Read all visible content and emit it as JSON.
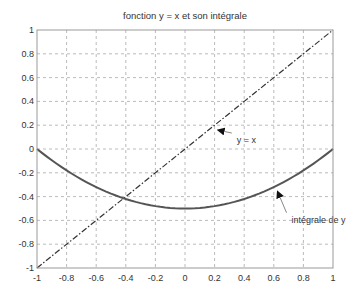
{
  "chart_data": {
    "type": "line",
    "title": "fonction y = x et son intégrale",
    "xlabel": "",
    "ylabel": "",
    "xlim": [
      -1,
      1
    ],
    "ylim": [
      -1,
      1
    ],
    "grid": true,
    "xticks": [
      -1,
      -0.8,
      -0.6,
      -0.4,
      -0.2,
      0,
      0.2,
      0.4,
      0.6,
      0.8,
      1
    ],
    "yticks": [
      -1,
      -0.8,
      -0.6,
      -0.4,
      -0.2,
      0,
      0.2,
      0.4,
      0.6,
      0.8,
      1
    ],
    "xtick_labels": [
      "-1",
      "-0.8",
      "-0.6",
      "-0.4",
      "-0.2",
      "0",
      "0.2",
      "0.4",
      "0.6",
      "0.8",
      "1"
    ],
    "ytick_labels": [
      "-1",
      "-0.8",
      "-0.6",
      "-0.4",
      "-0.2",
      "0",
      "0.2",
      "0.4",
      "0.6",
      "0.8",
      "1"
    ],
    "series": [
      {
        "name": "y = x",
        "style": "dash-dot",
        "color": "#333333",
        "x": [
          -1,
          -0.8,
          -0.6,
          -0.4,
          -0.2,
          0,
          0.2,
          0.4,
          0.6,
          0.8,
          1
        ],
        "y": [
          -1,
          -0.8,
          -0.6,
          -0.4,
          -0.2,
          0,
          0.2,
          0.4,
          0.6,
          0.8,
          1
        ]
      },
      {
        "name": "intégrale de y",
        "style": "solid",
        "color": "#555555",
        "x": [
          -1,
          -0.8,
          -0.6,
          -0.4,
          -0.2,
          0,
          0.2,
          0.4,
          0.6,
          0.8,
          1
        ],
        "y": [
          0,
          -0.18,
          -0.32,
          -0.42,
          -0.48,
          -0.5,
          -0.48,
          -0.42,
          -0.32,
          -0.18,
          0
        ]
      }
    ],
    "annotations": [
      {
        "text": "y = x",
        "arrow_to": [
          0.2,
          0.2
        ],
        "text_at": [
          0.35,
          0.05
        ]
      },
      {
        "text": "intégrale de y",
        "arrow_to": [
          0.6,
          -0.32
        ],
        "text_at": [
          0.72,
          -0.62
        ]
      }
    ]
  }
}
